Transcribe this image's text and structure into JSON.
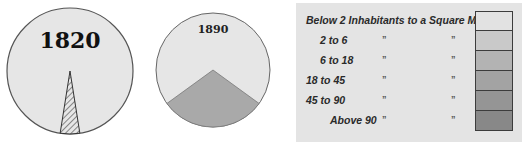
{
  "chart_data": [
    {
      "type": "pie",
      "title": "1820",
      "slices": [
        {
          "label": "Settled area",
          "value": 5,
          "pattern": "hatched"
        },
        {
          "label": "Unsettled area",
          "value": 95,
          "pattern": "plain"
        }
      ]
    },
    {
      "type": "pie",
      "title": "1890",
      "slices": [
        {
          "label": "Settled area",
          "value": 30,
          "pattern": "shaded"
        },
        {
          "label": "Unsettled area",
          "value": 70,
          "pattern": "plain"
        }
      ]
    }
  ],
  "legend": {
    "rows": [
      {
        "label": "Below 2 Inhabitants to a Square Mile",
        "ditto": false,
        "color": "#e2e2e2"
      },
      {
        "label": "2 to   6",
        "ditto": true,
        "color": "#c9c9c9"
      },
      {
        "label": "6 to 18",
        "ditto": true,
        "color": "#b3b3b3"
      },
      {
        "label": "18 to 45",
        "ditto": true,
        "color": "#a3a3a3"
      },
      {
        "label": "45 to 90",
        "ditto": true,
        "color": "#959595"
      },
      {
        "label": "Above 90",
        "ditto": true,
        "color": "#888888"
      }
    ],
    "ditto_mark": "”"
  },
  "colors": {
    "pie_fill": "#e6e6e6",
    "pie_border": "#555555",
    "wedge_1890": "#a9a9a9",
    "hatch": "#444444"
  }
}
